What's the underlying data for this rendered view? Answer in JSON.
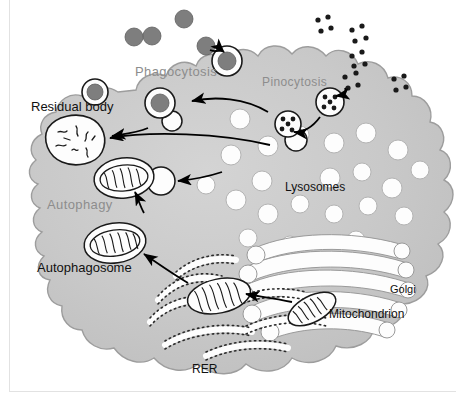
{
  "diagram": {
    "cell_fill": "#c9c9c9",
    "cell_stroke": "#9a9a9a",
    "organelle_fill": "#ffffff",
    "organelle_stroke": "#1a1a1a",
    "particle_fill": "#7a7a7a",
    "arrow_color": "#000000",
    "label_dark": "#111111",
    "label_gray": "#8d8d8d"
  },
  "labels": {
    "phagocytosis": "Phagocytosis",
    "pinocytosis": "Pinocytosis",
    "residual_body": "Residual body",
    "lysosomes": "Lysosomes",
    "autophagy": "Autophagy",
    "autophagosome": "Autophagosome",
    "golgi": "Golgi",
    "mitochondrion": "Mitochondrion",
    "rer": "RER"
  },
  "label_positions": {
    "phagocytosis": {
      "x": 135,
      "y": 64,
      "size": 13,
      "tone": "gray"
    },
    "pinocytosis": {
      "x": 263,
      "y": 76,
      "size": 12,
      "tone": "gray"
    },
    "residual_body": {
      "x": 32,
      "y": 100,
      "size": 13,
      "tone": "dark"
    },
    "lysosomes": {
      "x": 285,
      "y": 181,
      "size": 12,
      "tone": "dark"
    },
    "autophagy": {
      "x": 47,
      "y": 198,
      "size": 13,
      "tone": "gray"
    },
    "autophagosome": {
      "x": 38,
      "y": 261,
      "size": 13,
      "tone": "dark"
    },
    "golgi": {
      "x": 390,
      "y": 284,
      "size": 11,
      "tone": "dark"
    },
    "mitochondrion": {
      "x": 329,
      "y": 308,
      "size": 12,
      "tone": "dark"
    },
    "rer": {
      "x": 192,
      "y": 363,
      "size": 12,
      "tone": "dark"
    }
  },
  "structures": {
    "external_particles": [
      {
        "cx": 152,
        "cy": 22,
        "r": 9
      },
      {
        "cx": 185,
        "cy": 12,
        "r": 9
      },
      {
        "cx": 206,
        "cy": 48,
        "r": 9
      },
      {
        "cx": 234,
        "cy": 55,
        "r": 9
      }
    ],
    "phagosomes": [
      {
        "cx": 225,
        "cy": 58,
        "r": 13,
        "inner": 8
      },
      {
        "cx": 160,
        "cy": 103,
        "r": 12,
        "inner": 0
      },
      {
        "cx": 190,
        "cy": 88,
        "r": 12,
        "inner": 7
      }
    ],
    "pinocytic_clusters": [
      {
        "cx": 355,
        "cy": 33
      },
      {
        "cx": 352,
        "cy": 61
      },
      {
        "cx": 372,
        "cy": 38
      },
      {
        "cx": 400,
        "cy": 85
      }
    ],
    "pinocytic_vesicles": [
      {
        "cx": 330,
        "cy": 100,
        "r": 12
      },
      {
        "cx": 288,
        "cy": 125,
        "r": 12
      }
    ],
    "lysosome_count": 22,
    "golgi_cisternae": 5,
    "rer_strands": 6
  },
  "flow_steps": [
    "Phagocytosis of large particles forms a phagosome",
    "Pinocytosis of fluid droplets forms pinocytic vesicles",
    "Lysosomes fuse with vesicles",
    "Autophagy engulfs organelles into an autophagosome",
    "Undigested material remains as a residual body"
  ]
}
